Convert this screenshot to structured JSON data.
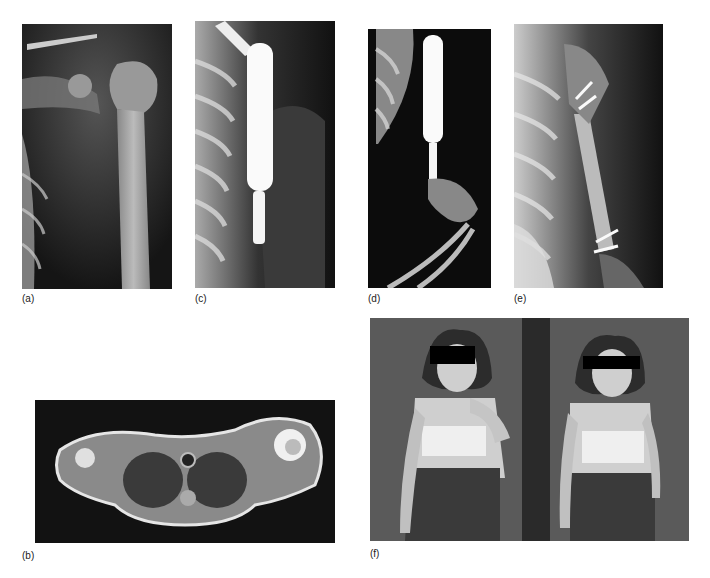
{
  "figure": {
    "panels": [
      {
        "id": "a",
        "label": "(a)",
        "type": "x-ray",
        "description": "Shoulder radiograph showing proximal humerus lesion"
      },
      {
        "id": "b",
        "label": "(b)",
        "type": "mri-axial",
        "description": "Axial MRI through shoulders with bright lesion in left humeral head"
      },
      {
        "id": "c",
        "label": "(c)",
        "type": "x-ray",
        "description": "Radiograph with expandable metal prosthesis in proximal humerus"
      },
      {
        "id": "d",
        "label": "(d)",
        "type": "x-ray",
        "description": "Radiograph of prosthesis with flexed elbow"
      },
      {
        "id": "e",
        "label": "(e)",
        "type": "x-ray",
        "description": "Radiograph showing humeral graft fixed with screws"
      },
      {
        "id": "f",
        "label": "(f)",
        "type": "photograph",
        "description": "Clinical photographs of patient demonstrating arm function, eyes masked"
      }
    ]
  }
}
